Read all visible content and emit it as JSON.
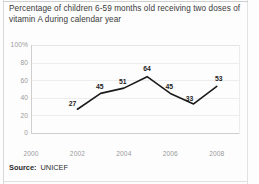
{
  "chart_data": {
    "type": "line",
    "title": "Percentage of children 6-59 months old receiving two doses of vitamin A during calendar year",
    "title_line1": "Percentage of children 6-59 months old receiving two doses",
    "title_line2": "of vitamin A during calendar year",
    "xlabel": "",
    "ylabel": "",
    "ylim": [
      0,
      100
    ],
    "xlim": [
      2000,
      2009
    ],
    "grid": true,
    "legend": "none",
    "y_ticks": [
      "100%",
      "80",
      "60",
      "40",
      "20",
      "0"
    ],
    "y_tick_values": [
      100,
      80,
      60,
      40,
      20,
      0
    ],
    "x_ticks": [
      "2000",
      "2002",
      "2004",
      "2006",
      "2008"
    ],
    "x_tick_values": [
      2000,
      2002,
      2004,
      2006,
      2008
    ],
    "x": [
      2002,
      2003,
      2004,
      2005,
      2006,
      2007,
      2008
    ],
    "values": [
      27,
      45,
      51,
      64,
      45,
      33,
      53
    ],
    "point_labels": [
      "27",
      "45",
      "51",
      "64",
      "45",
      "33",
      "53"
    ],
    "line_color": "#1a1a1a",
    "grid_color": "#ededed",
    "axis_color": "#cfcfcf"
  },
  "source": {
    "label": "Source:",
    "value": "UNICEF"
  }
}
